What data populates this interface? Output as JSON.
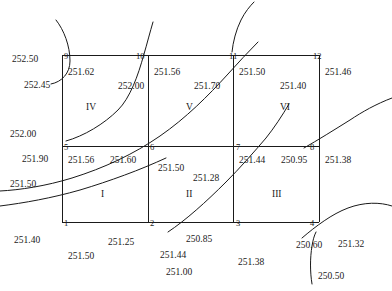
{
  "diagram": {
    "type": "contour-grid",
    "grid": {
      "left": 62,
      "right": 319,
      "top": 55,
      "middle_y": 146,
      "bottom": 222,
      "div_x1": 148,
      "div_x2": 233,
      "stroke": "#1a1a1a"
    },
    "regions": [
      {
        "name": "I",
        "x": 101,
        "y": 190
      },
      {
        "name": "II",
        "x": 186,
        "y": 190
      },
      {
        "name": "III",
        "x": 272,
        "y": 190
      },
      {
        "name": "IV",
        "x": 86,
        "y": 103
      },
      {
        "name": "V",
        "x": 186,
        "y": 103
      },
      {
        "name": "VI",
        "x": 280,
        "y": 103
      }
    ],
    "nodes": [
      {
        "id": "1",
        "x": 64,
        "y": 219
      },
      {
        "id": "2",
        "x": 150,
        "y": 219
      },
      {
        "id": "3",
        "x": 236,
        "y": 219
      },
      {
        "id": "4",
        "x": 310,
        "y": 219
      },
      {
        "id": "5",
        "x": 64,
        "y": 143
      },
      {
        "id": "6",
        "x": 150,
        "y": 143
      },
      {
        "id": "7",
        "x": 236,
        "y": 143
      },
      {
        "id": "8",
        "x": 310,
        "y": 143
      },
      {
        "id": "9",
        "x": 64,
        "y": 52
      },
      {
        "id": "10",
        "x": 136,
        "y": 52
      },
      {
        "id": "11",
        "x": 229,
        "y": 52
      },
      {
        "id": "12",
        "x": 313,
        "y": 52
      }
    ],
    "elevations": [
      {
        "value": "252.50",
        "x": 12,
        "y": 55
      },
      {
        "value": "252.45",
        "x": 24,
        "y": 81
      },
      {
        "value": "251.62",
        "x": 68,
        "y": 68
      },
      {
        "value": "252.00",
        "x": 118,
        "y": 82
      },
      {
        "value": "251.56",
        "x": 154,
        "y": 68
      },
      {
        "value": "251.70",
        "x": 194,
        "y": 82
      },
      {
        "value": "251.50",
        "x": 239,
        "y": 68
      },
      {
        "value": "251.40",
        "x": 280,
        "y": 82
      },
      {
        "value": "251.46",
        "x": 325,
        "y": 68
      },
      {
        "value": "252.00",
        "x": 10,
        "y": 130
      },
      {
        "value": "251.90",
        "x": 22,
        "y": 155
      },
      {
        "value": "251.50",
        "x": 10,
        "y": 180
      },
      {
        "value": "251.56",
        "x": 68,
        "y": 156
      },
      {
        "value": "251.60",
        "x": 110,
        "y": 156
      },
      {
        "value": "251.50",
        "x": 158,
        "y": 164
      },
      {
        "value": "251.28",
        "x": 193,
        "y": 174
      },
      {
        "value": "251.44",
        "x": 239,
        "y": 156
      },
      {
        "value": "250.95",
        "x": 281,
        "y": 156
      },
      {
        "value": "251.38",
        "x": 325,
        "y": 156
      },
      {
        "value": "251.40",
        "x": 14,
        "y": 236
      },
      {
        "value": "251.50",
        "x": 68,
        "y": 252
      },
      {
        "value": "251.25",
        "x": 108,
        "y": 238
      },
      {
        "value": "250.85",
        "x": 186,
        "y": 235
      },
      {
        "value": "251.44",
        "x": 160,
        "y": 251
      },
      {
        "value": "251.00",
        "x": 166,
        "y": 268
      },
      {
        "value": "251.38",
        "x": 238,
        "y": 258
      },
      {
        "value": "250.60",
        "x": 296,
        "y": 241
      },
      {
        "value": "251.32",
        "x": 338,
        "y": 240
      },
      {
        "value": "250.50",
        "x": 318,
        "y": 272
      }
    ],
    "contours": [
      {
        "name": "contour-top-left-hook",
        "d": "M 51,84 C 62,82 70,73 70,61 C 70,46 64,30 56,20"
      },
      {
        "name": "contour-252-00",
        "d": "M 66,141 C 84,136 104,124 118,110 C 130,98 138,76 144,54 C 147,44 150,32 153,22"
      },
      {
        "name": "contour-top-center",
        "d": "M 232,52 C 233,42 236,30 241,20 C 245,12 250,6 254,2"
      },
      {
        "name": "contour-main-diagonal",
        "d": "M 0,191 C 20,190 46,186 72,178 C 104,168 134,154 160,136 C 186,118 208,96 228,74 C 238,63 248,52 258,42"
      },
      {
        "name": "contour-lower-left",
        "d": "M 0,206 C 24,203 52,198 80,190 C 110,181 140,170 166,158"
      },
      {
        "name": "contour-bottom-diagonal",
        "d": "M 168,232 C 186,220 206,202 226,182 C 240,168 254,152 266,138 C 274,128 282,116 289,104"
      },
      {
        "name": "contour-right-upper",
        "d": "M 304,148 C 318,140 334,130 350,120 C 362,112 376,104 392,98"
      },
      {
        "name": "contour-bottom-right-a",
        "d": "M 302,238 C 316,226 332,214 348,208 C 364,202 380,202 392,206"
      },
      {
        "name": "contour-bottom-right-b",
        "d": "M 312,284 C 310,272 310,258 312,246 C 313,240 314,236 316,232"
      }
    ]
  }
}
